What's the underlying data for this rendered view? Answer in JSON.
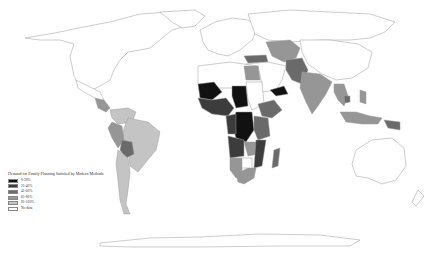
{
  "map": {
    "title": "Demand for Family Planning Satisfied by Modern Methods",
    "type": "choropleth world map (grayscale)"
  },
  "legend": {
    "title": "Demand for Family Planning Satisfied by Modern Methods",
    "items": [
      {
        "label": "0-20%",
        "color": "#111111"
      },
      {
        "label": "21-40%",
        "color": "#3c3c3c"
      },
      {
        "label": "41-60%",
        "color": "#6a6a6a"
      },
      {
        "label": "61-80%",
        "color": "#969696"
      },
      {
        "label": "81-100%",
        "color": "#c4c4c4"
      },
      {
        "label": "No data",
        "color": "#ffffff"
      }
    ]
  },
  "colors": {
    "c0": "#111111",
    "c1": "#3c3c3c",
    "c2": "#6a6a6a",
    "c3": "#969696",
    "c4": "#c4c4c4",
    "nodata": "#ffffff",
    "border": "#9a9a9a"
  }
}
